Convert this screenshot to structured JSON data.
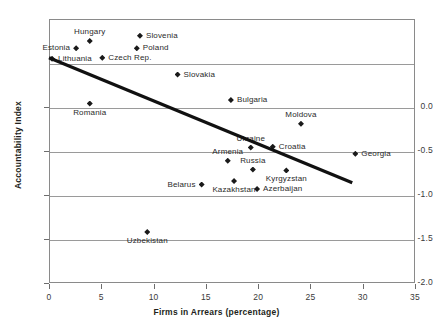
{
  "chart_data": {
    "type": "scatter",
    "title": "",
    "xlabel": "Firms in Arrears (percentage)",
    "ylabel": "Accountability Index",
    "xlim": [
      0,
      35
    ],
    "ylim": [
      -2.0,
      1.0
    ],
    "xticks": [
      "0",
      "5",
      "10",
      "15",
      "20",
      "25",
      "30",
      "35"
    ],
    "xtick_values": [
      0,
      5,
      10,
      15,
      20,
      25,
      30,
      35
    ],
    "yticks": [
      "0.0",
      "-0.5",
      "-1.0",
      "-1.5",
      "-2.0"
    ],
    "ytick_values": [
      0.0,
      -0.5,
      -1.0,
      -1.5,
      -2.0
    ],
    "gridlines_y": [
      0.5,
      0.0,
      -0.5,
      -1.0,
      -1.5
    ],
    "grid": true,
    "legend": "none",
    "marker": "diamond",
    "marker_color": "#1a1a1a",
    "trendline": {
      "name": "linear fit",
      "color": "#111111",
      "x_start": 0.0,
      "y_start": 0.56,
      "x_end": 29.0,
      "y_end": -0.86
    },
    "points": [
      {
        "label": "Estonia",
        "x": 2.5,
        "y": 0.68,
        "label_pos": "left"
      },
      {
        "label": "Hungary",
        "x": 3.8,
        "y": 0.76,
        "label_pos": "abovec"
      },
      {
        "label": "Lithuania",
        "x": 0.2,
        "y": 0.56,
        "label_pos": "right"
      },
      {
        "label": "Czech Rep.",
        "x": 5.0,
        "y": 0.57,
        "label_pos": "right"
      },
      {
        "label": "Slovenia",
        "x": 8.6,
        "y": 0.82,
        "label_pos": "right"
      },
      {
        "label": "Poland",
        "x": 8.3,
        "y": 0.68,
        "label_pos": "right"
      },
      {
        "label": "Slovakia",
        "x": 12.2,
        "y": 0.38,
        "label_pos": "right"
      },
      {
        "label": "Romania",
        "x": 3.8,
        "y": 0.05,
        "label_pos": "belowc"
      },
      {
        "label": "Bulgaria",
        "x": 17.3,
        "y": 0.09,
        "label_pos": "right"
      },
      {
        "label": "Moldova",
        "x": 24.0,
        "y": -0.18,
        "label_pos": "abovec"
      },
      {
        "label": "Ukraine",
        "x": 19.2,
        "y": -0.45,
        "label_pos": "abovec"
      },
      {
        "label": "Croatia",
        "x": 21.3,
        "y": -0.44,
        "label_pos": "right"
      },
      {
        "label": "Georgia",
        "x": 29.2,
        "y": -0.52,
        "label_pos": "right"
      },
      {
        "label": "Armenia",
        "x": 17.0,
        "y": -0.6,
        "label_pos": "abovec"
      },
      {
        "label": "Russia",
        "x": 19.4,
        "y": -0.7,
        "label_pos": "abovec"
      },
      {
        "label": "Kyrgyzstan",
        "x": 22.6,
        "y": -0.71,
        "label_pos": "belowc"
      },
      {
        "label": "Kazakhstan",
        "x": 17.6,
        "y": -0.83,
        "label_pos": "belowc"
      },
      {
        "label": "Belarus",
        "x": 14.5,
        "y": -0.87,
        "label_pos": "left"
      },
      {
        "label": "Azerbaijan",
        "x": 19.8,
        "y": -0.92,
        "label_pos": "right"
      },
      {
        "label": "Uzbekistan",
        "x": 9.3,
        "y": -1.41,
        "label_pos": "belowc"
      }
    ]
  }
}
